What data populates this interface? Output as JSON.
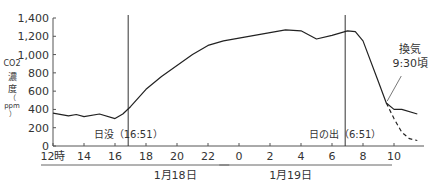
{
  "chart_data": {
    "type": "line",
    "title": "",
    "ylabel": "CO2濃度（ppm）",
    "ylabel_parts": [
      "CO2",
      "濃",
      "度",
      "（",
      "ppm",
      "）"
    ],
    "xlabel": "",
    "ylim": [
      0,
      1400
    ],
    "y_ticks": [
      "0",
      "200",
      "400",
      "600",
      "800",
      "1,000",
      "1,200",
      "1,400"
    ],
    "x_ticks": [
      "12時",
      "14",
      "16",
      "18",
      "20",
      "22",
      "0",
      "2",
      "4",
      "6",
      "8",
      "10"
    ],
    "x_groups": [
      {
        "label": "1月18日",
        "from": 12,
        "to": 23.5
      },
      {
        "label": "1月19日",
        "from": 23.5,
        "to": 34
      }
    ],
    "grid": false,
    "series": [
      {
        "name": "CO2濃度",
        "style": "solid",
        "x": [
          12,
          13,
          13.5,
          14,
          15,
          16,
          16.5,
          17,
          18,
          19,
          20,
          21,
          22,
          23,
          24,
          25,
          26,
          27,
          28,
          29,
          30,
          31,
          31.5,
          32,
          33,
          33.5,
          34,
          34.5,
          35.5
        ],
        "values": [
          360,
          330,
          345,
          320,
          350,
          300,
          350,
          430,
          620,
          760,
          880,
          1000,
          1100,
          1150,
          1180,
          1210,
          1240,
          1270,
          1260,
          1170,
          1210,
          1260,
          1250,
          1150,
          700,
          470,
          400,
          400,
          350
        ]
      },
      {
        "name": "換気後（推定）",
        "style": "dashed",
        "x": [
          33.5,
          34,
          34.5,
          35,
          35.5
        ],
        "values": [
          470,
          300,
          150,
          80,
          60
        ]
      }
    ],
    "annotations": [
      {
        "text": "日没（16:51）",
        "x": 16.85,
        "type": "vline"
      },
      {
        "text": "日の出（6:51）",
        "x": 30.85,
        "type": "vline"
      },
      {
        "text": "換気",
        "text2": "9:30頃",
        "x": 33.5,
        "y": 470,
        "type": "callout"
      }
    ]
  }
}
